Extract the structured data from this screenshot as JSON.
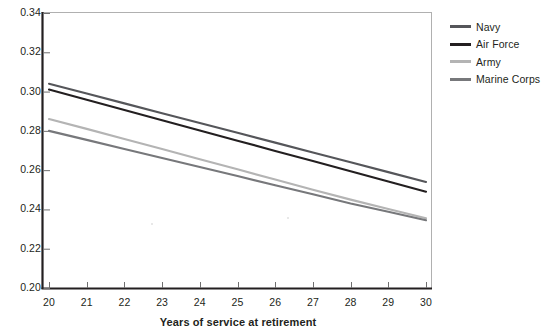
{
  "chart_data": {
    "type": "line",
    "title": "",
    "xlabel": "Years of service at retirement",
    "ylabel": "",
    "xlim": [
      20,
      30
    ],
    "ylim": [
      0.2,
      0.34
    ],
    "grid": false,
    "legend_position": "right",
    "x": [
      20,
      21,
      22,
      23,
      24,
      25,
      26,
      27,
      28,
      29,
      30
    ],
    "xticklabels": [
      "20",
      "21",
      "22",
      "23",
      "24",
      "25",
      "26",
      "27",
      "28",
      "29",
      "30"
    ],
    "yticks": [
      0.2,
      0.22,
      0.24,
      0.26,
      0.28,
      0.3,
      0.32,
      0.34
    ],
    "yticklabels": [
      "0.20",
      "0.22",
      "0.24",
      "0.26",
      "0.28",
      "0.30",
      "0.32",
      "0.34"
    ],
    "series": [
      {
        "name": "Navy",
        "color": "#55565a",
        "values": [
          0.304,
          0.299,
          0.294,
          0.289,
          0.284,
          0.279,
          0.274,
          0.269,
          0.264,
          0.259,
          0.254
        ]
      },
      {
        "name": "Air Force",
        "color": "#231f20",
        "values": [
          0.301,
          0.2958,
          0.2906,
          0.2854,
          0.2802,
          0.275,
          0.2698,
          0.2646,
          0.2594,
          0.2542,
          0.249
        ]
      },
      {
        "name": "Army",
        "color": "#b4b4b4",
        "values": [
          0.286,
          0.281,
          0.2759,
          0.2708,
          0.2656,
          0.2604,
          0.2552,
          0.25,
          0.245,
          0.2402,
          0.2355
        ]
      },
      {
        "name": "Marine Corps",
        "color": "#77787b",
        "values": [
          0.28,
          0.2754,
          0.2708,
          0.2662,
          0.2616,
          0.257,
          0.2523,
          0.2477,
          0.243,
          0.2388,
          0.2345
        ]
      }
    ]
  },
  "axes": {
    "left_axis_color": "#231f20",
    "bottom_axis_color": "#231f20",
    "frame_color": "#b0b0b0"
  }
}
